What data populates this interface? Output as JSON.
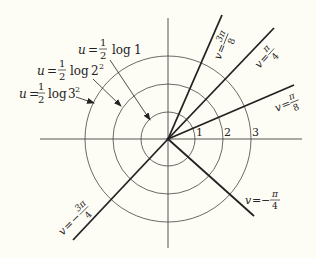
{
  "diagram": {
    "origin": [
      168,
      139
    ],
    "axes": {
      "horizontal": {
        "x1": 40,
        "x2": 302
      },
      "vertical": {
        "y1": 18,
        "y2": 248
      }
    },
    "circles": [
      {
        "r": 27,
        "tick_label": "1"
      },
      {
        "r": 55,
        "tick_label": "2"
      },
      {
        "r": 83,
        "tick_label": "3"
      }
    ],
    "level_curve_labels": [
      {
        "var": "u",
        "eq": "=",
        "num": "1",
        "den": "2",
        "fn": "log",
        "arg": "1",
        "sup": ""
      },
      {
        "var": "u",
        "eq": "=",
        "num": "1",
        "den": "2",
        "fn": "log",
        "arg": "2",
        "sup": "2"
      },
      {
        "var": "u",
        "eq": "=",
        "num": "1",
        "den": "2",
        "fn": "log",
        "arg": "3",
        "sup": "2"
      }
    ],
    "rays": [
      {
        "label_var": "v",
        "sign": "",
        "num": "3π",
        "den": "8",
        "end": [
          222,
          15
        ]
      },
      {
        "label_var": "v",
        "sign": "",
        "num": "π",
        "den": "4",
        "end": [
          274,
          28
        ]
      },
      {
        "label_var": "v",
        "sign": "",
        "num": "π",
        "den": "8",
        "end": [
          294,
          85
        ]
      },
      {
        "label_var": "v",
        "sign": "−",
        "num": "π",
        "den": "4",
        "end": [
          254,
          216
        ]
      },
      {
        "label_var": "v",
        "sign": "−",
        "num": "3π",
        "den": "4",
        "end": [
          73,
          240
        ]
      }
    ]
  }
}
